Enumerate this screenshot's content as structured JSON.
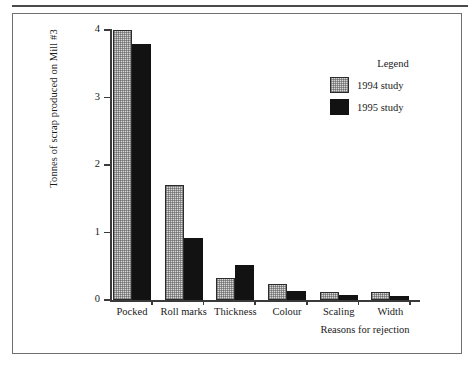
{
  "figure": {
    "has_top_rule": true,
    "frame_border_color": "#6f6f72",
    "background": "#ffffff"
  },
  "legend": {
    "title": "Legend",
    "entries": [
      {
        "label": "1994 study",
        "swatch": "light-hatched-swatch",
        "color": "#d8d8d8"
      },
      {
        "label": "1995 study",
        "swatch": "solid-black-swatch",
        "color": "#121212"
      }
    ]
  },
  "chart_data": {
    "type": "bar",
    "title": "",
    "xlabel": "Reasons for rejection",
    "ylabel": "Tonnes of scrap produced on Mill #3",
    "categories": [
      "Pocked",
      "Roll marks",
      "Thickness",
      "Colour",
      "Scaling",
      "Width"
    ],
    "series": [
      {
        "name": "1994 study",
        "color": "#d8d8d8",
        "values": [
          4.0,
          1.7,
          0.33,
          0.23,
          0.12,
          0.12
        ]
      },
      {
        "name": "1995 study",
        "color": "#121212",
        "values": [
          3.8,
          0.92,
          0.52,
          0.13,
          0.08,
          0.06
        ]
      }
    ],
    "ylim": [
      0,
      4
    ],
    "yticks": [
      0,
      1,
      2,
      3,
      4
    ],
    "ytick_labels": [
      "0",
      "1",
      "2",
      "3",
      "4"
    ],
    "grid": false,
    "legend_position": "upper-right"
  }
}
